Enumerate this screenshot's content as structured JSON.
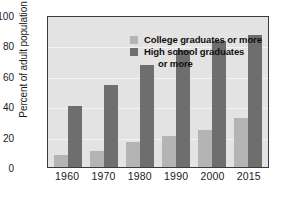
{
  "chart_data": {
    "type": "bar",
    "title": "",
    "xlabel": "",
    "ylabel": "Percent of adult population",
    "categories": [
      "1960",
      "1970",
      "1980",
      "1990",
      "2000",
      "2015"
    ],
    "series": [
      {
        "name": "College graduates or more",
        "color": "#b4b4b4",
        "values": [
          7.7,
          11,
          17,
          21,
          25,
          33
        ]
      },
      {
        "name": "High school graduates or more",
        "color": "#6e6e6e",
        "values": [
          41,
          55,
          68,
          78,
          84,
          88
        ]
      }
    ],
    "ylim": [
      0,
      100
    ],
    "yticks": [
      "0",
      "20",
      "40",
      "60",
      "80",
      "100"
    ],
    "ytick_values": [
      0,
      20,
      40,
      60,
      80,
      100
    ],
    "grid": true,
    "legend_position": "top-center",
    "plot_background": "#e3e3e3"
  },
  "legend": {
    "entry1_label": "College graduates or more",
    "entry2_label_line1": "High school graduates",
    "entry2_label_line2": "or more"
  }
}
